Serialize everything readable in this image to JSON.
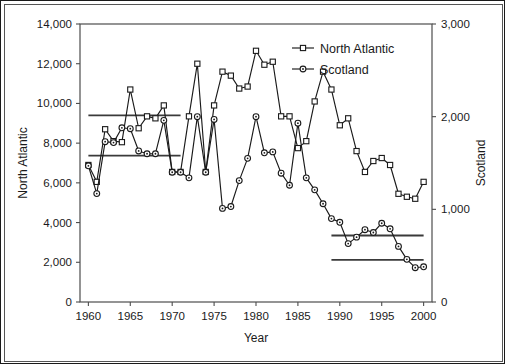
{
  "chart_data": {
    "type": "line",
    "title": "",
    "xlabel": "Year",
    "ylabel": "North Atlantic",
    "y2label": "Scotland",
    "xlim": [
      1959,
      2001
    ],
    "ylim": [
      0,
      14000
    ],
    "y2lim": [
      0,
      3000
    ],
    "grid": false,
    "legend_position": "top-right",
    "xticks": [
      "1960",
      "1965",
      "1970",
      "1975",
      "1980",
      "1985",
      "1990",
      "1995",
      "2000"
    ],
    "xtick_values": [
      1960,
      1965,
      1970,
      1975,
      1980,
      1985,
      1990,
      1995,
      2000
    ],
    "yticks": [
      "0",
      "2,000",
      "4,000",
      "6,000",
      "8,000",
      "10,000",
      "12,000",
      "14,000"
    ],
    "ytick_values": [
      0,
      2000,
      4000,
      6000,
      8000,
      10000,
      12000,
      14000
    ],
    "y2ticks": [
      "0",
      "1,000",
      "2,000",
      "3,000"
    ],
    "y2tick_values": [
      0,
      1000,
      2000,
      3000
    ],
    "x": [
      1960,
      1961,
      1962,
      1963,
      1964,
      1965,
      1966,
      1967,
      1968,
      1969,
      1970,
      1971,
      1972,
      1973,
      1974,
      1975,
      1976,
      1977,
      1978,
      1979,
      1980,
      1981,
      1982,
      1983,
      1984,
      1985,
      1986,
      1987,
      1988,
      1989,
      1990,
      1991,
      1992,
      1993,
      1994,
      1995,
      1996,
      1997,
      1998,
      1999,
      2000
    ],
    "series": [
      {
        "name": "North Atlantic",
        "axis": "left",
        "marker": "square",
        "values": [
          6900,
          6050,
          8700,
          8100,
          8050,
          10700,
          8750,
          9350,
          9250,
          9900,
          6550,
          6550,
          9350,
          12000,
          6550,
          9900,
          11600,
          11400,
          10750,
          10850,
          12650,
          11950,
          12100,
          9350,
          9350,
          7750,
          8100,
          10100,
          11600,
          10700,
          8900,
          9250,
          7600,
          6550,
          7100,
          7250,
          6900,
          5450,
          5300,
          5200,
          6050
        ]
      },
      {
        "name": "Scotland",
        "axis": "right",
        "marker": "circle",
        "values": [
          1470,
          1170,
          1730,
          1720,
          1880,
          1870,
          1630,
          1600,
          1600,
          1960,
          1400,
          1400,
          1340,
          2000,
          1400,
          1970,
          1010,
          1030,
          1310,
          1550,
          2000,
          1610,
          1620,
          1390,
          1260,
          1930,
          1340,
          1210,
          1060,
          900,
          860,
          630,
          700,
          780,
          750,
          850,
          790,
          600,
          460,
          370,
          380
        ]
      }
    ],
    "reference_lines": [
      {
        "name": "north-atlantic-early-mean",
        "axis": "left",
        "value": 9400,
        "x_start": 1960,
        "x_end": 1971
      },
      {
        "name": "scotland-early-mean",
        "axis": "right",
        "value": 1580,
        "x_start": 1960,
        "x_end": 1971
      },
      {
        "name": "north-atlantic-late-mean",
        "axis": "left",
        "value": 3350,
        "x_start": 1989,
        "x_end": 2000
      },
      {
        "name": "scotland-late-mean",
        "axis": "right",
        "value": 455,
        "x_start": 1989,
        "x_end": 2000
      }
    ]
  },
  "legend": {
    "items": [
      {
        "label": "North Atlantic",
        "marker": "square"
      },
      {
        "label": "Scotland",
        "marker": "circle"
      }
    ]
  }
}
